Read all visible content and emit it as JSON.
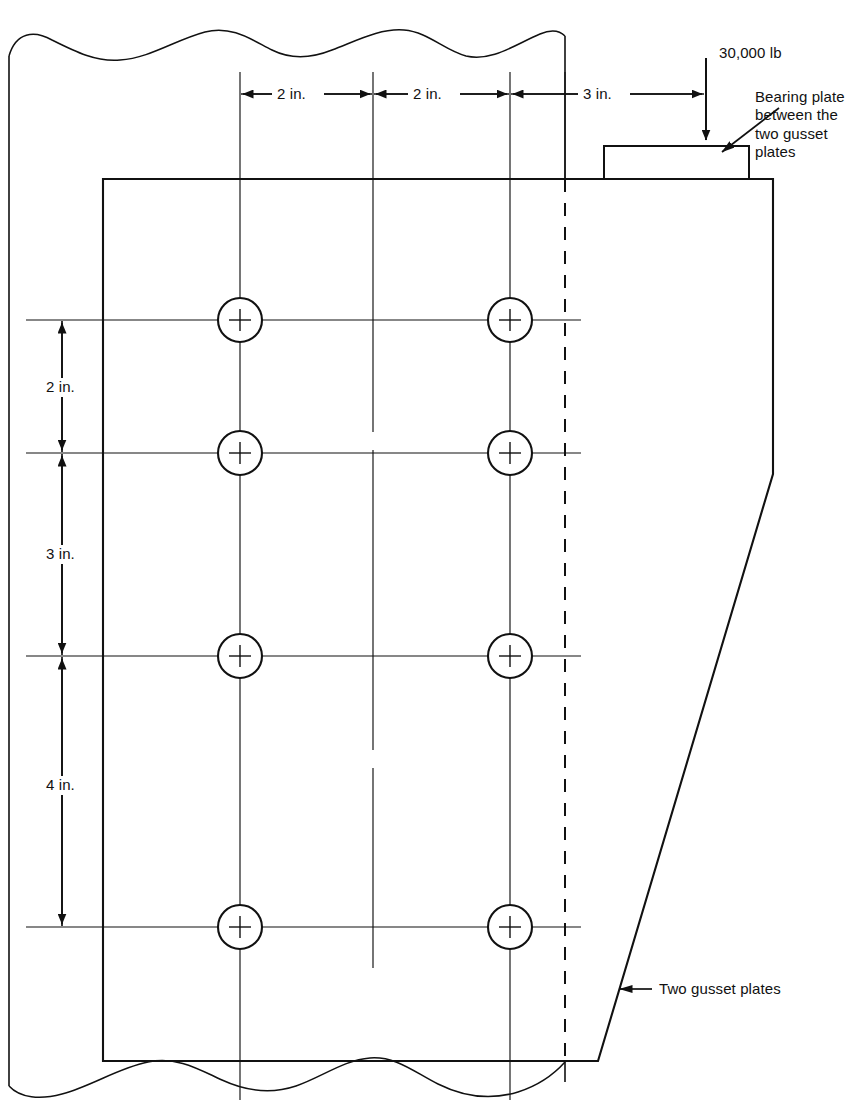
{
  "figure": {
    "type": "engineering-drawing",
    "units": "inches / pounds"
  },
  "labels": {
    "load": "30,000 lb",
    "bearing_plate": "Bearing plate between the two gusset plates",
    "bearing_plate_line1": "Bearing plate",
    "bearing_plate_line2": "between the",
    "bearing_plate_line3": "two gusset",
    "bearing_plate_line4": "plates",
    "gusset": "Two gusset plates"
  },
  "dimensions": {
    "horizontal": [
      {
        "id": "h1",
        "text": "2 in.",
        "value": 2,
        "from_x": 240,
        "to_x": 373
      },
      {
        "id": "h2",
        "text": "2 in.",
        "value": 2,
        "from_x": 373,
        "to_x": 510
      },
      {
        "id": "h3",
        "text": "3 in.",
        "value": 3,
        "from_x": 510,
        "to_x": 706
      }
    ],
    "vertical": [
      {
        "id": "v1",
        "text": "2 in.",
        "value": 2,
        "from_y": 320,
        "to_y": 453
      },
      {
        "id": "v2",
        "text": "3 in.",
        "value": 3,
        "from_y": 453,
        "to_y": 656
      },
      {
        "id": "v3",
        "text": "4 in.",
        "value": 4,
        "from_y": 656,
        "to_y": 927
      }
    ]
  },
  "bolts": {
    "radius": 22,
    "columns_x": [
      240,
      510
    ],
    "rows_y": [
      320,
      453,
      656,
      927
    ],
    "count": 8
  },
  "colors": {
    "line": "#111111",
    "background": "#ffffff",
    "text": "#111111"
  }
}
